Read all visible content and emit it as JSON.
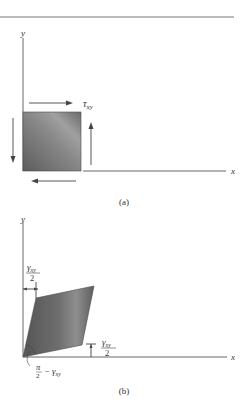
{
  "figure": {
    "panel_a": {
      "caption": "(a)",
      "y_axis_label": "y",
      "x_axis_label": "x",
      "stress_label": {
        "symbol": "τ",
        "subscript": "xy"
      },
      "element": "square",
      "arrows": [
        "top-right",
        "right-up",
        "left-down",
        "bottom-left"
      ]
    },
    "panel_b": {
      "caption": "(b)",
      "y_axis_label": "y",
      "x_axis_label": "x",
      "element": "parallelogram",
      "top_angle_label": {
        "numerator_symbol": "γ",
        "numerator_subscript": "xy",
        "denominator": "2"
      },
      "right_angle_label": {
        "numerator_symbol": "γ",
        "numerator_subscript": "xy",
        "denominator": "2"
      },
      "corner_angle_label": {
        "pi": "π",
        "two": "2",
        "minus": "−",
        "gamma": "γ",
        "subscript": "xy"
      }
    },
    "colors": {
      "element_dark": "#5a5a5a",
      "element_light": "#9a9a9a",
      "line": "#555555"
    }
  }
}
